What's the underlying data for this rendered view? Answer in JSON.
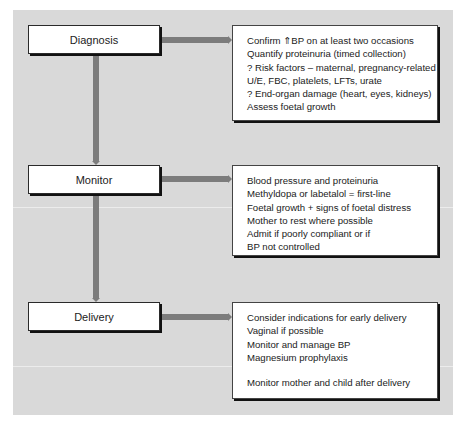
{
  "colors": {
    "panel_background": "#d9d9d9",
    "page_background": "#ffffff",
    "connector": "#7c7c7c",
    "box_fill": "#ffffff",
    "box_shadow": "#111111",
    "text": "#222222"
  },
  "stages": [
    {
      "label": "Diagnosis",
      "details": [
        "Confirm ⇑BP on at least two occasions",
        "Quantify proteinuria (timed collection)",
        "? Risk factors – maternal, pregnancy-related",
        "U/E, FBC, platelets, LFTs, urate",
        "? End-organ damage (heart, eyes, kidneys)",
        "Assess foetal growth"
      ]
    },
    {
      "label": "Monitor",
      "details": [
        "Blood pressure and proteinuria",
        "Methyldopa or labetalol = first-line",
        "Foetal growth + signs of foetal distress",
        "Mother to rest where possible",
        "Admit if poorly compliant or if",
        "BP not controlled"
      ]
    },
    {
      "label": "Delivery",
      "details": [
        "Consider indications for early delivery",
        "Vaginal if possible",
        "Monitor and manage BP",
        "Magnesium prophylaxis"
      ],
      "details_after_gap": [
        "Monitor mother and child after delivery"
      ]
    }
  ]
}
